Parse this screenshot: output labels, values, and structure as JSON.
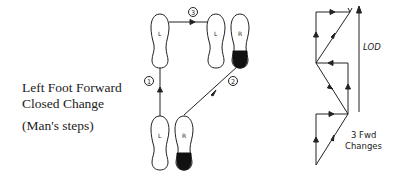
{
  "title": {
    "line1": "Left Foot Forward",
    "line2": "Closed Change",
    "subtitle": "(Man's steps)"
  },
  "footwork": {
    "feet": [
      {
        "id": "start-left",
        "label": "L",
        "heel_shaded": false
      },
      {
        "id": "start-right",
        "label": "R",
        "heel_shaded": true
      },
      {
        "id": "end-left",
        "label": "L",
        "heel_shaded": false
      },
      {
        "id": "end-right",
        "label": "R",
        "heel_shaded": true
      }
    ],
    "steps": [
      {
        "number": "1",
        "label": "1"
      },
      {
        "number": "2",
        "label": "2"
      },
      {
        "number": "3",
        "label": "3"
      }
    ]
  },
  "floor_pattern": {
    "direction_label": "LOD",
    "caption_line1": "3 Fwd",
    "caption_line2": "Changes"
  },
  "colors": {
    "ink": "#222222",
    "background": "#ffffff"
  }
}
